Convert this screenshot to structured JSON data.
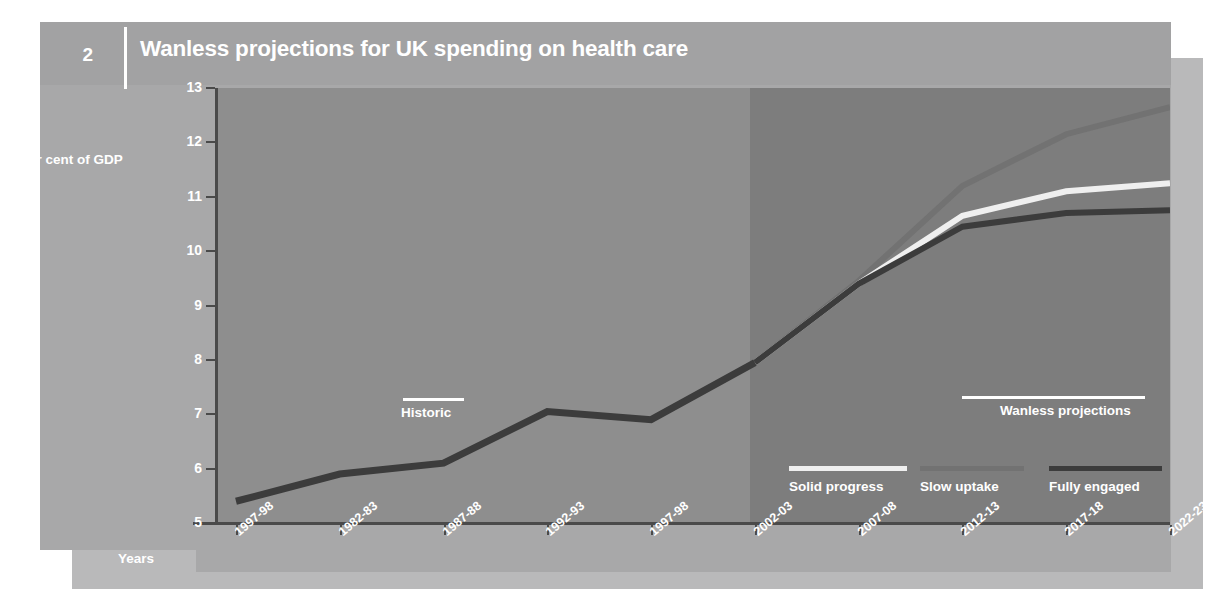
{
  "header": {
    "figure_number": "2",
    "title": "Wanless projections for UK spending on health care"
  },
  "axes": {
    "y_axis_label": "Per cent of GDP",
    "x_axis_label": "Years",
    "y_ticks": [
      "13",
      "12",
      "11",
      "10",
      "9",
      "8",
      "7",
      "6",
      "5"
    ],
    "x_ticks": [
      "1997-98",
      "1982-83",
      "1987-88",
      "1992-93",
      "1997-98",
      "2002-03",
      "2007-08",
      "2012-13",
      "2017-18",
      "2022-23"
    ]
  },
  "annotations": {
    "historic": "Historic",
    "projections": "Wanless projections"
  },
  "legend": [
    {
      "label": "Solid progress",
      "color": "#efefef"
    },
    {
      "label": "Slow uptake",
      "color": "#727272"
    },
    {
      "label": "Fully engaged",
      "color": "#3c3c3c"
    }
  ],
  "colors": {
    "page": "#a8a8a9",
    "shadow": "#b9b9ba",
    "header_band": "#a2a2a3",
    "plot_historic_bg": "#8e8e8e",
    "plot_projection_bg": "#7d7d7d",
    "axis": "#4a4a4a",
    "historic_line": "#3c3c3c",
    "text": "#ffffff"
  },
  "chart_data": {
    "type": "line",
    "title": "Wanless projections for UK spending on health care",
    "xlabel": "Years",
    "ylabel": "Per cent of GDP",
    "ylim": [
      5,
      13
    ],
    "grid": false,
    "legend_position": "inside-bottom-right",
    "categories": [
      "1997-98",
      "1982-83",
      "1987-88",
      "1992-93",
      "1997-98",
      "2002-03",
      "2007-08",
      "2012-13",
      "2017-18",
      "2022-23"
    ],
    "projection_starts_at": "2002-03",
    "series": [
      {
        "name": "Historic",
        "color": "#3c3c3c",
        "values": [
          5.4,
          5.9,
          6.1,
          7.05,
          6.9,
          7.95,
          null,
          null,
          null,
          null
        ]
      },
      {
        "name": "Solid progress",
        "color": "#efefef",
        "values": [
          null,
          null,
          null,
          null,
          null,
          7.95,
          9.4,
          10.65,
          11.1,
          11.25
        ]
      },
      {
        "name": "Slow uptake",
        "color": "#727272",
        "values": [
          null,
          null,
          null,
          null,
          null,
          7.95,
          9.45,
          11.2,
          12.15,
          12.65
        ]
      },
      {
        "name": "Fully engaged",
        "color": "#3c3c3c",
        "values": [
          null,
          null,
          null,
          null,
          null,
          7.95,
          9.4,
          10.45,
          10.7,
          10.75
        ]
      }
    ]
  }
}
